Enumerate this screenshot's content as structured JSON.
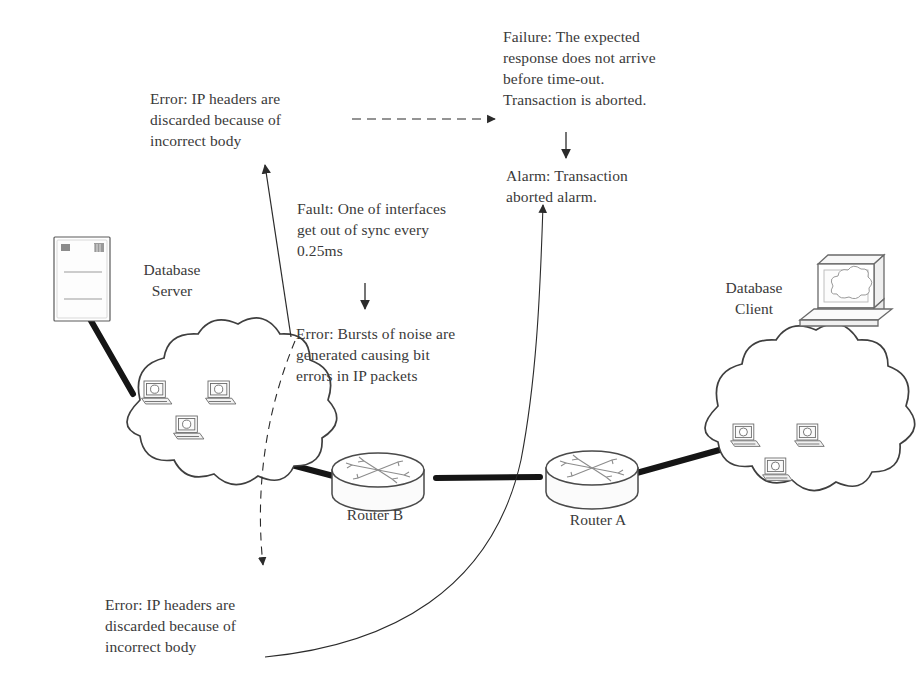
{
  "diagram": {
    "background_color": "#ffffff",
    "line_color": "#3a3a3a",
    "thick_link_color": "#1a1a1a"
  },
  "annotations": [
    {
      "id": "failure",
      "kind": "Failure",
      "text": "Failure: The expected\nresponse does not arrive\nbefore time-out.\nTransaction is aborted."
    },
    {
      "id": "alarm",
      "kind": "Alarm",
      "text": "Alarm: Transaction\naborted alarm."
    },
    {
      "id": "error-top",
      "kind": "Error",
      "text": "Error: IP headers are\ndiscarded because of\nincorrect body"
    },
    {
      "id": "fault",
      "kind": "Fault",
      "text": "Fault: One of interfaces\nget out of sync every\n0.25ms"
    },
    {
      "id": "error-middle",
      "kind": "Error",
      "text": "Error: Bursts of noise are\ngenerated causing bit\nerrors in IP packets"
    },
    {
      "id": "error-bottom",
      "kind": "Error",
      "text": "Error: IP headers are\ndiscarded because of\nincorrect body"
    }
  ],
  "nodes": [
    {
      "id": "db-server",
      "label": "Database\nServer",
      "icon": "server-tower-icon"
    },
    {
      "id": "cloud-left",
      "label": "",
      "icon": "network-cloud-icon"
    },
    {
      "id": "router-b",
      "label": "Router  B",
      "icon": "router-icon"
    },
    {
      "id": "router-a",
      "label": "Router  A",
      "icon": "router-icon"
    },
    {
      "id": "cloud-right",
      "label": "",
      "icon": "network-cloud-icon"
    },
    {
      "id": "db-client",
      "label": "Database\nClient",
      "icon": "workstation-icon"
    }
  ]
}
